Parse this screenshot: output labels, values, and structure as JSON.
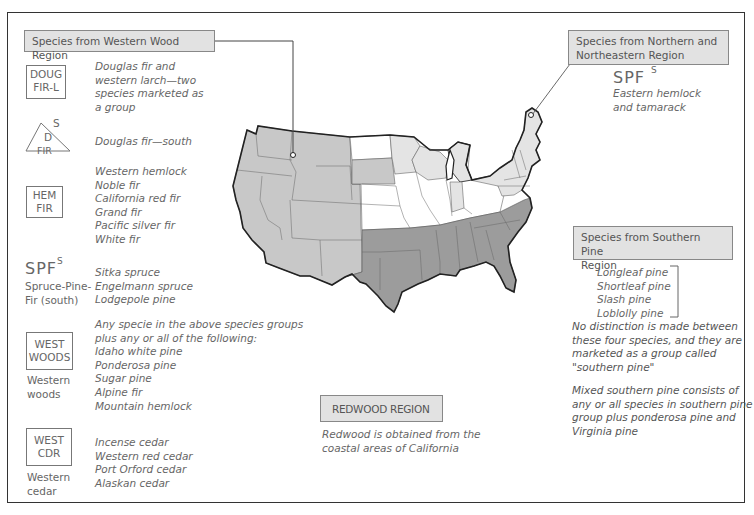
{
  "western": {
    "title": "Species from Western Wood Region",
    "groups": [
      {
        "symbol": [
          "DOUG",
          "FIR-L"
        ],
        "species": [
          "Douglas fir and",
          "western larch—two",
          "species marketed as",
          "a group"
        ]
      },
      {
        "symbol_top": "S",
        "symbol": [
          "D",
          "FIR"
        ],
        "species": [
          "Douglas fir—south"
        ]
      },
      {
        "symbol": [
          "HEM",
          "FIR"
        ],
        "species": [
          "Western hemlock",
          "Noble fir",
          "California red fir",
          "Grand fir",
          "Pacific silver fir",
          "White fir"
        ]
      },
      {
        "symbol_big": "SPF",
        "symbol_sup": "S",
        "caption": [
          "Spruce-Pine-",
          "Fir (south)"
        ],
        "species": [
          "Sitka spruce",
          "Engelmann spruce",
          "Lodgepole pine"
        ]
      },
      {
        "symbol": [
          "WEST",
          "WOODS"
        ],
        "caption": [
          "Western",
          "woods"
        ],
        "species": [
          "Any specie in the above species groups",
          "plus any or all of the following:",
          "Idaho white pine",
          "Ponderosa pine",
          "Sugar pine",
          "Alpine fir",
          "Mountain hemlock"
        ]
      },
      {
        "symbol": [
          "WEST",
          "CDR"
        ],
        "caption": [
          "Western",
          "cedar"
        ],
        "species": [
          "Incense cedar",
          "Western red cedar",
          "Port Orford cedar",
          "Alaskan cedar"
        ]
      }
    ]
  },
  "northern": {
    "title": [
      "Species from Northern and",
      "Northeastern Region"
    ],
    "symbol": "SPF",
    "symbol_sup": "S",
    "species": [
      "Eastern hemlock",
      "and tamarack"
    ]
  },
  "southern": {
    "title": [
      "Species from Southern Pine",
      "Region"
    ],
    "species": [
      "Longleaf pine",
      "Shortleaf pine",
      "Slash pine",
      "Loblolly pine"
    ],
    "note1": [
      "No distinction is made between",
      "these four species, and they are",
      "marketed as a group called",
      "\"southern pine\""
    ],
    "note2": [
      "Mixed southern pine consists of",
      "any or all species in southern pine",
      "group plus ponderosa pine and",
      "Virginia pine"
    ]
  },
  "redwood": {
    "title": "REDWOOD REGION",
    "text": [
      "Redwood is obtained from the",
      "coastal areas of California"
    ]
  },
  "map": {
    "colors": {
      "western": "#c8c8c8",
      "northern": "#e4e4e4",
      "southern": "#9c9c9c",
      "unassigned": "#ffffff",
      "border": "#222222",
      "state_line": "#666666"
    }
  }
}
